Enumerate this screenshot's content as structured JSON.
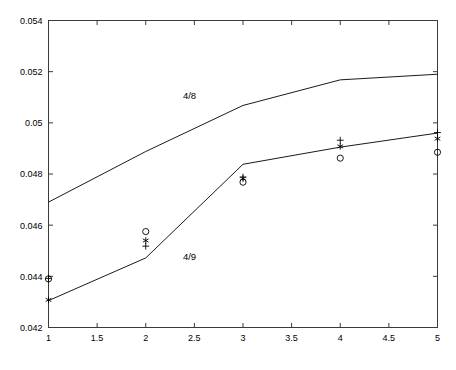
{
  "chart_data": {
    "type": "line",
    "title": "",
    "subtitle": "",
    "xlabel": "",
    "ylabel": "",
    "xlim": [
      1,
      5
    ],
    "ylim": [
      0.042,
      0.054
    ],
    "grid": false,
    "legend_position": "inline-annotation",
    "x_ticks": [
      1,
      1.5,
      2,
      2.5,
      3,
      3.5,
      4,
      4.5,
      5
    ],
    "x_tick_labels": [
      "1",
      "1.5",
      "2",
      "2.5",
      "3",
      "3.5",
      "4",
      "4.5",
      "5"
    ],
    "y_ticks": [
      0.042,
      0.044,
      0.046,
      0.048,
      0.05,
      0.052,
      0.054
    ],
    "y_tick_labels": [
      "0.042",
      "0.044",
      "0.046",
      "0.048",
      "0.05",
      "0.052",
      "0.054"
    ],
    "annotations": [
      {
        "text": "4/8",
        "x": 2.45,
        "y": 0.05095
      },
      {
        "text": "4/9",
        "x": 2.45,
        "y": 0.04465
      }
    ],
    "series": [
      {
        "name": "4/8",
        "style": "line",
        "color": "#000000",
        "x": [
          1,
          2,
          3,
          4,
          5
        ],
        "values": [
          0.0469,
          0.04888,
          0.05068,
          0.05168,
          0.0519
        ]
      },
      {
        "name": "4/9",
        "style": "line",
        "color": "#000000",
        "x": [
          1,
          2,
          3,
          4,
          5
        ],
        "values": [
          0.04305,
          0.04472,
          0.04838,
          0.04905,
          0.0496
        ]
      }
    ],
    "marker_series": [
      {
        "name": "circle-markers",
        "marker": "o",
        "color": "#000000",
        "x": [
          1,
          2,
          3,
          4,
          5
        ],
        "values": [
          0.0439,
          0.04575,
          0.04768,
          0.04862,
          0.04885
        ]
      },
      {
        "name": "asterisk-markers",
        "marker": "*",
        "color": "#000000",
        "x": [
          1,
          2,
          3,
          4,
          5
        ],
        "values": [
          0.04308,
          0.0454,
          0.04782,
          0.04908,
          0.04938
        ]
      },
      {
        "name": "plus-markers",
        "marker": "+",
        "color": "#000000",
        "x": [
          1,
          2,
          3,
          4,
          5
        ],
        "values": [
          0.04392,
          0.04518,
          0.04788,
          0.04932,
          0.04962
        ]
      }
    ]
  },
  "axis": {
    "box_color": "#3a3a3a",
    "line_color": "#555555"
  }
}
